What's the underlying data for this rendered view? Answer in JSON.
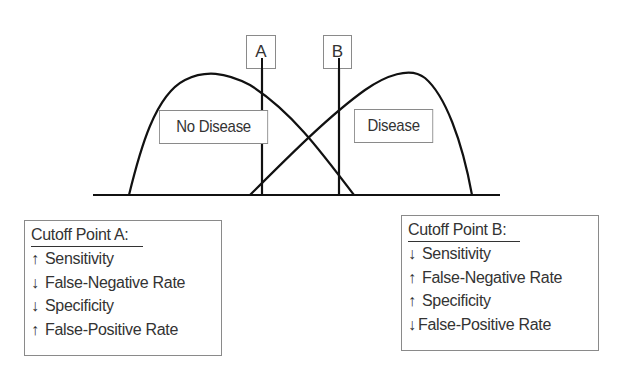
{
  "diagram": {
    "distributions": [
      {
        "name": "no_disease",
        "label": "No Disease"
      },
      {
        "name": "disease",
        "label": "Disease"
      }
    ],
    "cutoffs": [
      {
        "id": "A",
        "label": "A"
      },
      {
        "id": "B",
        "label": "B"
      }
    ]
  },
  "legend_a": {
    "title": "Cutoff Point A:",
    "items": [
      {
        "arrow": "↑",
        "text": "Sensitivity"
      },
      {
        "arrow": "↓",
        "text": "False-Negative Rate"
      },
      {
        "arrow": "↓",
        "text": "Specificity"
      },
      {
        "arrow": "↑",
        "text": "False-Positive Rate"
      }
    ]
  },
  "legend_b": {
    "title": "Cutoff Point B:",
    "items": [
      {
        "arrow": "↓",
        "text": "Sensitivity"
      },
      {
        "arrow": "↑",
        "text": "False-Negative Rate"
      },
      {
        "arrow": "↑",
        "text": "Specificity"
      },
      {
        "arrow": "↓",
        "text": "False-Positive Rate"
      }
    ]
  },
  "colors": {
    "stroke": "#111111",
    "box_border": "#8a8a8a",
    "text": "#333333"
  }
}
